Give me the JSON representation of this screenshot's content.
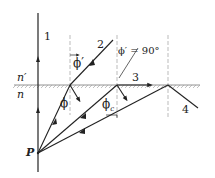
{
  "diagram": {
    "type": "ray-optics-refraction",
    "medium_labels": {
      "upper": "n′",
      "lower": "n"
    },
    "point_label": "P",
    "ray_labels": [
      "1",
      "2",
      "3",
      "4"
    ],
    "angle_labels": {
      "phi_prime": "ϕ′",
      "phi_prime_90": "ϕ′ = 90°",
      "phi": "ϕ",
      "phi_c": "ϕ",
      "phi_c_sub": "c"
    },
    "colors": {
      "line": "#222222",
      "dashed": "#aaaaaa",
      "hatch": "#888888"
    }
  }
}
